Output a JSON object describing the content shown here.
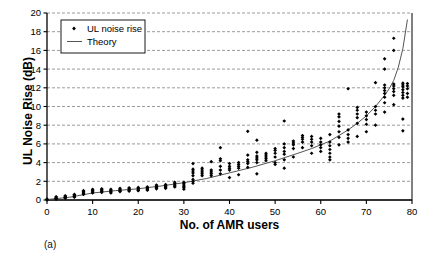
{
  "figure": {
    "panel_label": "(a)",
    "background": "#ffffff",
    "foreground": "#000000"
  },
  "chart_data": {
    "type": "scatter",
    "title": "",
    "xlabel": "No. of AMR users",
    "ylabel": "UL Noise Rise (dB)",
    "xlim": [
      0,
      80
    ],
    "ylim": [
      0,
      20
    ],
    "xticks": [
      0,
      10,
      20,
      30,
      40,
      50,
      60,
      70,
      80
    ],
    "yticks": [
      0,
      2,
      4,
      6,
      8,
      10,
      12,
      14,
      16,
      18,
      20
    ],
    "xtick_labels": [
      "0",
      "10",
      "20",
      "30",
      "40",
      "50",
      "60",
      "70",
      "80"
    ],
    "ytick_labels": [
      "0",
      "2",
      "4",
      "6",
      "8",
      "10",
      "12",
      "14",
      "16",
      "18",
      "20"
    ],
    "grid": {
      "horizontal": true,
      "vertical": false,
      "style": "dashed",
      "color": "#808080"
    },
    "legend": {
      "position": "top-left",
      "box": true,
      "entries": [
        {
          "label": "UL noise rise",
          "marker": "diamond",
          "color": "#000000"
        },
        {
          "label": "Theory",
          "marker": "line",
          "color": "#555555"
        }
      ]
    },
    "series": [
      {
        "name": "UL noise rise",
        "type": "scatter",
        "marker": "diamond",
        "color": "#000000",
        "points": [
          [
            0,
            0.0
          ],
          [
            0,
            0.05
          ],
          [
            0,
            0.1
          ],
          [
            2,
            0.15
          ],
          [
            2,
            0.2
          ],
          [
            2,
            0.3
          ],
          [
            2,
            0.35
          ],
          [
            2,
            0.1
          ],
          [
            4,
            0.25
          ],
          [
            4,
            0.3
          ],
          [
            4,
            0.4
          ],
          [
            4,
            0.45
          ],
          [
            4,
            0.2
          ],
          [
            6,
            0.35
          ],
          [
            6,
            0.45
          ],
          [
            6,
            0.55
          ],
          [
            6,
            0.6
          ],
          [
            6,
            0.3
          ],
          [
            8,
            0.7
          ],
          [
            8,
            0.8
          ],
          [
            8,
            0.9
          ],
          [
            8,
            1.0
          ],
          [
            8,
            0.6
          ],
          [
            10,
            0.75
          ],
          [
            10,
            0.85
          ],
          [
            10,
            0.95
          ],
          [
            10,
            1.05
          ],
          [
            10,
            1.15
          ],
          [
            12,
            0.8
          ],
          [
            12,
            0.9
          ],
          [
            12,
            1.0
          ],
          [
            12,
            1.1
          ],
          [
            12,
            1.2
          ],
          [
            14,
            0.85
          ],
          [
            14,
            0.95
          ],
          [
            14,
            1.05
          ],
          [
            14,
            1.15
          ],
          [
            14,
            0.75
          ],
          [
            16,
            0.95
          ],
          [
            16,
            1.05
          ],
          [
            16,
            1.15
          ],
          [
            16,
            1.25
          ],
          [
            16,
            0.9
          ],
          [
            18,
            1.0
          ],
          [
            18,
            1.1
          ],
          [
            18,
            1.2
          ],
          [
            18,
            1.3
          ],
          [
            18,
            0.95
          ],
          [
            20,
            1.05
          ],
          [
            20,
            1.15
          ],
          [
            20,
            1.25
          ],
          [
            20,
            1.35
          ],
          [
            20,
            1.0
          ],
          [
            22,
            1.1
          ],
          [
            22,
            1.2
          ],
          [
            22,
            1.3
          ],
          [
            22,
            1.4
          ],
          [
            22,
            1.05
          ],
          [
            24,
            1.3
          ],
          [
            24,
            1.4
          ],
          [
            24,
            1.5
          ],
          [
            24,
            1.6
          ],
          [
            24,
            1.2
          ],
          [
            26,
            1.35
          ],
          [
            26,
            1.45
          ],
          [
            26,
            1.55
          ],
          [
            26,
            1.65
          ],
          [
            26,
            1.25
          ],
          [
            28,
            1.4
          ],
          [
            28,
            1.5
          ],
          [
            28,
            1.6
          ],
          [
            28,
            1.75
          ],
          [
            28,
            1.9
          ],
          [
            30,
            1.15
          ],
          [
            30,
            1.3
          ],
          [
            30,
            1.45
          ],
          [
            30,
            1.6
          ],
          [
            30,
            1.75
          ],
          [
            30,
            1.9
          ],
          [
            32,
            1.8
          ],
          [
            32,
            2.0
          ],
          [
            32,
            2.2
          ],
          [
            32,
            2.6
          ],
          [
            32,
            2.9
          ],
          [
            32,
            3.1
          ],
          [
            32,
            3.3
          ],
          [
            32,
            3.9
          ],
          [
            34,
            2.6
          ],
          [
            34,
            2.8
          ],
          [
            34,
            3.0
          ],
          [
            34,
            3.2
          ],
          [
            34,
            3.4
          ],
          [
            36,
            2.6
          ],
          [
            36,
            2.8
          ],
          [
            36,
            3.0
          ],
          [
            36,
            3.2
          ],
          [
            36,
            4.1
          ],
          [
            38,
            2.8
          ],
          [
            38,
            3.2
          ],
          [
            38,
            3.6
          ],
          [
            38,
            4.2
          ],
          [
            38,
            4.4
          ],
          [
            38,
            5.6
          ],
          [
            40,
            2.4
          ],
          [
            40,
            3.2
          ],
          [
            40,
            3.4
          ],
          [
            40,
            3.6
          ],
          [
            40,
            3.9
          ],
          [
            42,
            2.7
          ],
          [
            42,
            3.4
          ],
          [
            42,
            3.6
          ],
          [
            42,
            3.8
          ],
          [
            42,
            4.0
          ],
          [
            44,
            3.5
          ],
          [
            44,
            3.9
          ],
          [
            44,
            4.1
          ],
          [
            44,
            4.3
          ],
          [
            44,
            4.8
          ],
          [
            44,
            7.35
          ],
          [
            46,
            2.8
          ],
          [
            46,
            4.0
          ],
          [
            46,
            4.3
          ],
          [
            46,
            4.5
          ],
          [
            46,
            4.7
          ],
          [
            46,
            5.1
          ],
          [
            46,
            6.4
          ],
          [
            48,
            4.2
          ],
          [
            48,
            4.4
          ],
          [
            48,
            4.6
          ],
          [
            48,
            4.8
          ],
          [
            48,
            5.0
          ],
          [
            50,
            3.8
          ],
          [
            50,
            4.0
          ],
          [
            50,
            4.6
          ],
          [
            50,
            5.0
          ],
          [
            50,
            5.3
          ],
          [
            50,
            5.5
          ],
          [
            52,
            3.4
          ],
          [
            52,
            4.3
          ],
          [
            52,
            4.9
          ],
          [
            52,
            5.2
          ],
          [
            52,
            5.6
          ],
          [
            52,
            6.0
          ],
          [
            52,
            8.45
          ],
          [
            54,
            4.6
          ],
          [
            54,
            5.5
          ],
          [
            54,
            5.9
          ],
          [
            54,
            6.1
          ],
          [
            54,
            6.3
          ],
          [
            56,
            5.6
          ],
          [
            56,
            6.2
          ],
          [
            56,
            6.5
          ],
          [
            56,
            6.7
          ],
          [
            56,
            6.9
          ],
          [
            58,
            5.0
          ],
          [
            58,
            5.8
          ],
          [
            58,
            6.2
          ],
          [
            58,
            6.5
          ],
          [
            58,
            6.8
          ],
          [
            60,
            5.2
          ],
          [
            60,
            5.6
          ],
          [
            60,
            5.9
          ],
          [
            60,
            6.2
          ],
          [
            60,
            6.6
          ],
          [
            62,
            4.3
          ],
          [
            62,
            4.6
          ],
          [
            62,
            5.0
          ],
          [
            62,
            5.4
          ],
          [
            62,
            5.8
          ],
          [
            62,
            6.2
          ],
          [
            62,
            7.0
          ],
          [
            64,
            5.9
          ],
          [
            64,
            6.7
          ],
          [
            64,
            7.3
          ],
          [
            64,
            7.9
          ],
          [
            64,
            8.4
          ],
          [
            64,
            8.9
          ],
          [
            64,
            9.2
          ],
          [
            66,
            6.2
          ],
          [
            66,
            6.6
          ],
          [
            66,
            7.0
          ],
          [
            66,
            7.5
          ],
          [
            66,
            11.9
          ],
          [
            68,
            6.8
          ],
          [
            68,
            8.2
          ],
          [
            68,
            8.8
          ],
          [
            68,
            9.2
          ],
          [
            68,
            9.6
          ],
          [
            68,
            9.9
          ],
          [
            70,
            7.3
          ],
          [
            70,
            8.1
          ],
          [
            70,
            8.6
          ],
          [
            70,
            9.0
          ],
          [
            70,
            9.4
          ],
          [
            72,
            8.0
          ],
          [
            72,
            9.2
          ],
          [
            72,
            9.6
          ],
          [
            72,
            10.0
          ],
          [
            72,
            12.55
          ],
          [
            74,
            9.4
          ],
          [
            74,
            10.4
          ],
          [
            74,
            11.0
          ],
          [
            74,
            11.4
          ],
          [
            74,
            11.7
          ],
          [
            74,
            12.0
          ],
          [
            74,
            12.3
          ],
          [
            74,
            14.0
          ],
          [
            74,
            15.1
          ],
          [
            76,
            10.2
          ],
          [
            76,
            11.2
          ],
          [
            76,
            11.6
          ],
          [
            76,
            11.9
          ],
          [
            76,
            12.2
          ],
          [
            76,
            12.4
          ],
          [
            76,
            16.0
          ],
          [
            76,
            17.3
          ],
          [
            78,
            7.4
          ],
          [
            78,
            8.65
          ],
          [
            78,
            10.9
          ],
          [
            78,
            11.2
          ],
          [
            78,
            11.5
          ],
          [
            78,
            11.8
          ],
          [
            78,
            12.1
          ],
          [
            78,
            12.3
          ],
          [
            78,
            12.5
          ],
          [
            79,
            11.0
          ],
          [
            79,
            11.4
          ],
          [
            79,
            11.9
          ],
          [
            79,
            12.2
          ],
          [
            79,
            12.45
          ]
        ]
      },
      {
        "name": "Theory",
        "type": "line",
        "color": "#555555",
        "points": [
          [
            0,
            0.05
          ],
          [
            5,
            0.3
          ],
          [
            10,
            0.75
          ],
          [
            15,
            1.0
          ],
          [
            20,
            1.2
          ],
          [
            25,
            1.5
          ],
          [
            30,
            1.85
          ],
          [
            35,
            2.3
          ],
          [
            40,
            2.9
          ],
          [
            45,
            3.5
          ],
          [
            50,
            4.2
          ],
          [
            55,
            5.0
          ],
          [
            58,
            5.5
          ],
          [
            60,
            5.9
          ],
          [
            62,
            6.3
          ],
          [
            64,
            6.9
          ],
          [
            66,
            7.5
          ],
          [
            68,
            8.2
          ],
          [
            70,
            9.0
          ],
          [
            72,
            10.0
          ],
          [
            74,
            11.2
          ],
          [
            75,
            11.9
          ],
          [
            76,
            12.8
          ],
          [
            77,
            14.2
          ],
          [
            78,
            16.2
          ],
          [
            79,
            19.3
          ]
        ]
      }
    ]
  }
}
